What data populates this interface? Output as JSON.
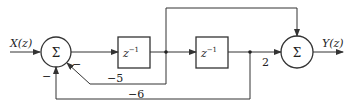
{
  "diagram": {
    "type": "block-diagram",
    "input_label": "X(z)",
    "output_label": "Y(z)",
    "summer1_symbol": "Σ",
    "summer2_symbol": "Σ",
    "delay1_label": "z",
    "delay1_exp": "−1",
    "delay2_label": "z",
    "delay2_exp": "−1",
    "gain_feedback1": "−5",
    "gain_feedback2": "−6",
    "gain_forward": "2",
    "sign_feedback1": "−",
    "sign_feedback2": "−",
    "colors": {
      "line": "#333333",
      "background": "#ffffff"
    }
  }
}
